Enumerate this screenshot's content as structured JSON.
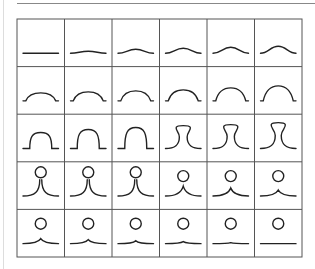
{
  "figure": {
    "grid": {
      "columns": 6,
      "rows": 5
    },
    "colors": {
      "stroke": "#222222",
      "grid_line": "#555555",
      "background": "#ffffff"
    },
    "frames": [
      {
        "row": 0,
        "col": 0,
        "shape": "flat",
        "h": 0
      },
      {
        "row": 0,
        "col": 1,
        "shape": "bump",
        "h": 2
      },
      {
        "row": 0,
        "col": 2,
        "shape": "bump",
        "h": 4
      },
      {
        "row": 0,
        "col": 3,
        "shape": "bump",
        "h": 5
      },
      {
        "row": 0,
        "col": 4,
        "shape": "bump",
        "h": 6
      },
      {
        "row": 0,
        "col": 5,
        "shape": "bump",
        "h": 7
      },
      {
        "row": 1,
        "col": 0,
        "shape": "dome",
        "h": 8
      },
      {
        "row": 1,
        "col": 1,
        "shape": "dome",
        "h": 9
      },
      {
        "row": 1,
        "col": 2,
        "shape": "dome",
        "h": 10
      },
      {
        "row": 1,
        "col": 3,
        "shape": "dome",
        "h": 11
      },
      {
        "row": 1,
        "col": 4,
        "shape": "dome",
        "h": 13
      },
      {
        "row": 1,
        "col": 5,
        "shape": "dome",
        "h": 15
      },
      {
        "row": 2,
        "col": 0,
        "shape": "arch",
        "h": 16
      },
      {
        "row": 2,
        "col": 1,
        "shape": "arch",
        "h": 19
      },
      {
        "row": 2,
        "col": 2,
        "shape": "arch",
        "h": 21
      },
      {
        "row": 2,
        "col": 3,
        "shape": "neck",
        "h": 23
      },
      {
        "row": 2,
        "col": 4,
        "shape": "neck",
        "h": 24
      },
      {
        "row": 2,
        "col": 5,
        "shape": "neck",
        "h": 26
      },
      {
        "row": 3,
        "col": 0,
        "shape": "pinch",
        "h": 30
      },
      {
        "row": 3,
        "col": 1,
        "shape": "pinch",
        "h": 30
      },
      {
        "row": 3,
        "col": 2,
        "shape": "pinch",
        "h": 30
      },
      {
        "row": 3,
        "col": 3,
        "shape": "drop",
        "h": 10
      },
      {
        "row": 3,
        "col": 4,
        "shape": "drop",
        "h": 8
      },
      {
        "row": 3,
        "col": 5,
        "shape": "drop",
        "h": 6
      },
      {
        "row": 4,
        "col": 0,
        "shape": "drop",
        "h": 5
      },
      {
        "row": 4,
        "col": 1,
        "shape": "drop",
        "h": 4
      },
      {
        "row": 4,
        "col": 2,
        "shape": "drop",
        "h": 3
      },
      {
        "row": 4,
        "col": 3,
        "shape": "drop",
        "h": 2
      },
      {
        "row": 4,
        "col": 4,
        "shape": "drop",
        "h": 1
      },
      {
        "row": 4,
        "col": 5,
        "shape": "drop",
        "h": 0
      }
    ]
  }
}
